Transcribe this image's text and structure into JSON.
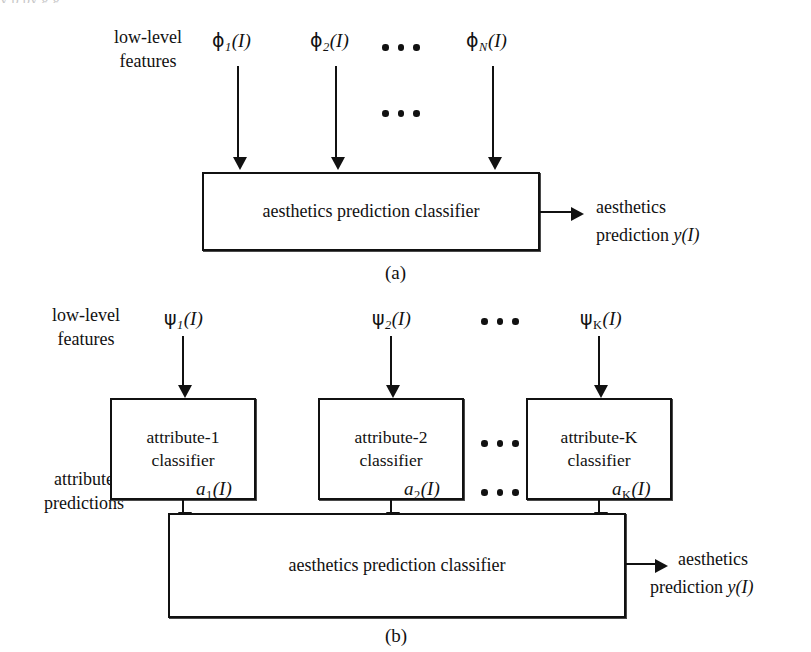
{
  "figure": {
    "background_color": "#ffffff",
    "ink_color": "#111111",
    "top_clipped_text": "y   p           py g      g"
  },
  "panel_a": {
    "caption": "(a)",
    "side_label_line1": "low-level",
    "side_label_line2": "features",
    "feature_inputs": [
      {
        "glyph": "ϕ",
        "subscript": "1",
        "arg": "(I)"
      },
      {
        "glyph": "ϕ",
        "subscript": "2",
        "arg": "(I)"
      },
      {
        "glyph": "ϕ",
        "subscript": "N",
        "arg": "(I)"
      }
    ],
    "ellipsis_symbol": "•••",
    "classifier_box": "aesthetics prediction classifier",
    "output_line1": "aesthetics",
    "output_line2_prefix": "prediction ",
    "output_line2_symbol": "y(I)"
  },
  "panel_b": {
    "caption": "(b)",
    "side_label_features_line1": "low-level",
    "side_label_features_line2": "features",
    "side_label_predictions_line1": "attribute",
    "side_label_predictions_line2": "predictions",
    "feature_inputs": [
      {
        "glyph": "ψ",
        "subscript": "1",
        "arg": "(I)"
      },
      {
        "glyph": "ψ",
        "subscript": "2",
        "arg": "(I)"
      },
      {
        "glyph": "ψ",
        "subscript": "K",
        "arg": "(I)"
      }
    ],
    "attribute_boxes": [
      {
        "line1": "attribute-1",
        "line2": "classifier"
      },
      {
        "line1": "attribute-2",
        "line2": "classifier"
      },
      {
        "line1": "attribute-K",
        "line2": "classifier"
      }
    ],
    "attribute_outputs": [
      {
        "glyph": "a",
        "subscript": "1",
        "arg": "(I)"
      },
      {
        "glyph": "a",
        "subscript": "2",
        "arg": "(I)"
      },
      {
        "glyph": "a",
        "subscript": "K",
        "arg": "(I)"
      }
    ],
    "ellipsis_symbol": "•••",
    "classifier_box": "aesthetics prediction classifier",
    "output_line1": "aesthetics",
    "output_line2_prefix": "prediction ",
    "output_line2_symbol": "y(I)"
  }
}
